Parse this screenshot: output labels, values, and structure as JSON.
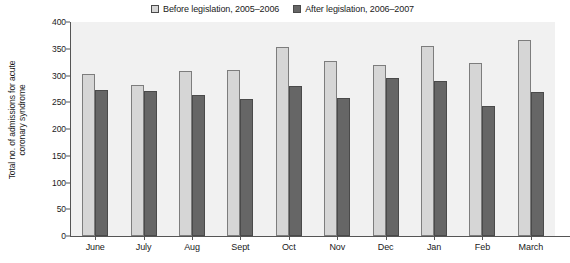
{
  "chart_data": {
    "type": "bar",
    "title": "",
    "subtitle": "",
    "xlabel": "",
    "ylabel": "Total no. of admissions for acute coronary syndrome",
    "ylabel_lines": [
      "Total no. of admissions for acute",
      "coronary syndrome"
    ],
    "categories": [
      "June",
      "July",
      "Aug",
      "Sept",
      "Oct",
      "Nov",
      "Dec",
      "Jan",
      "Feb",
      "March"
    ],
    "series": [
      {
        "name": "Before legislation, 2005–2006",
        "color": "#d6d6d6",
        "values": [
          302,
          282,
          309,
          311,
          353,
          327,
          319,
          355,
          324,
          366
        ]
      },
      {
        "name": "After legislation, 2006–2007",
        "color": "#666666",
        "values": [
          272,
          271,
          263,
          256,
          281,
          258,
          295,
          290,
          243,
          269
        ]
      }
    ],
    "ylim": [
      0,
      400
    ],
    "yticks": [
      0,
      50,
      100,
      150,
      200,
      250,
      300,
      350,
      400
    ],
    "ytick_labels": [
      "0",
      "50",
      "100",
      "150",
      "200",
      "250",
      "300",
      "350",
      "400"
    ],
    "grid": false,
    "legend_position": "top-center",
    "plot_background": "#f1f1f1",
    "axis_color": "#555555"
  },
  "legend": {
    "entries": [
      {
        "label": "Before legislation, 2005–2006",
        "swatch_color": "#d6d6d6"
      },
      {
        "label": "After legislation, 2006–2007",
        "swatch_color": "#666666"
      }
    ]
  }
}
